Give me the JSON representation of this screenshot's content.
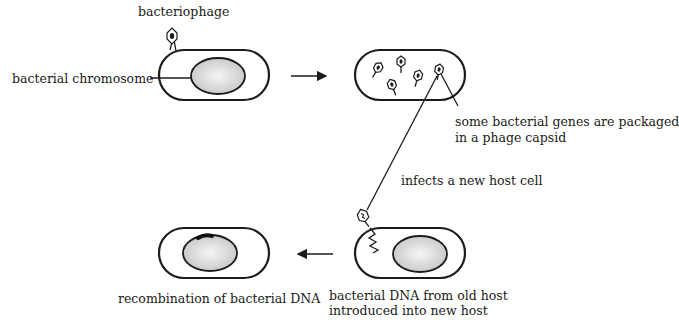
{
  "diagram": {
    "type": "generalized transduction",
    "labels": {
      "bacteriophage": "bacteriophage",
      "bacterial_chromosome": "bacterial chromosome",
      "packaged_line1": "some bacterial genes are packaged",
      "packaged_line2": "in a phage capsid",
      "infects": "infects a new host cell",
      "recombination": "recombination of bacterial DNA",
      "introduced_line1": "bacterial DNA from old host",
      "introduced_line2": "introduced into new host"
    },
    "steps": [
      {
        "id": "infection",
        "position": "top-left"
      },
      {
        "id": "packaging",
        "position": "top-right"
      },
      {
        "id": "transfer",
        "position": "bottom-right"
      },
      {
        "id": "recombination",
        "position": "bottom-left"
      }
    ],
    "colors": {
      "outline": "#1c1c1c",
      "nucleoid_light": "#f4f4f4",
      "nucleoid_dark": "#c8c8c8",
      "background": "#ffffff"
    }
  }
}
